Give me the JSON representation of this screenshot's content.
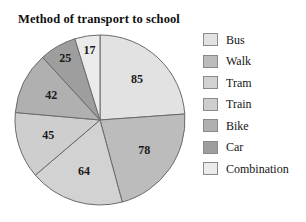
{
  "chart_title": "Method of transport to school",
  "chart_data": {
    "type": "pie",
    "title": "Method of transport to school",
    "xlabel": "",
    "ylabel": "",
    "legend_position": "right",
    "grid": false,
    "total": 356,
    "start_angle_deg": 0,
    "direction": "clockwise",
    "categories": [
      "Bus",
      "Walk",
      "Tram",
      "Train",
      "Bike",
      "Car",
      "Combination"
    ],
    "values": [
      85,
      78,
      64,
      45,
      42,
      25,
      17
    ],
    "colors": [
      "#e2e2e2",
      "#bcbcbc",
      "#d2d2d2",
      "#cecece",
      "#b0b0b0",
      "#9e9e9e",
      "#ebebeb"
    ],
    "slices": [
      {
        "label": "Bus",
        "value": 85,
        "color": "#e2e2e2"
      },
      {
        "label": "Walk",
        "value": 78,
        "color": "#bcbcbc"
      },
      {
        "label": "Tram",
        "value": 64,
        "color": "#d2d2d2"
      },
      {
        "label": "Train",
        "value": 45,
        "color": "#cecece"
      },
      {
        "label": "Bike",
        "value": 42,
        "color": "#b0b0b0"
      },
      {
        "label": "Car",
        "value": 25,
        "color": "#9e9e9e"
      },
      {
        "label": "Combination",
        "value": 17,
        "color": "#ebebeb"
      }
    ]
  },
  "legend": {
    "items": [
      {
        "label": "Bus",
        "color": "#e2e2e2"
      },
      {
        "label": "Walk",
        "color": "#bcbcbc"
      },
      {
        "label": "Tram",
        "color": "#d2d2d2"
      },
      {
        "label": "Train",
        "color": "#cecece"
      },
      {
        "label": "Bike",
        "color": "#b0b0b0"
      },
      {
        "label": "Car",
        "color": "#9e9e9e"
      },
      {
        "label": "Combination",
        "color": "#ebebeb"
      }
    ]
  }
}
